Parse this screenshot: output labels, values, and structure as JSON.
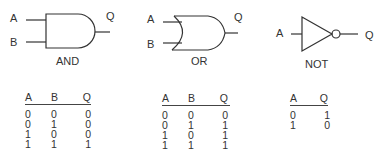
{
  "gates": [
    {
      "name": "AND",
      "inputs": [
        "A",
        "B"
      ],
      "output": "Q"
    },
    {
      "name": "OR",
      "inputs": [
        "A",
        "B"
      ],
      "output": "Q"
    },
    {
      "name": "NOT",
      "inputs": [
        "A"
      ],
      "output": "Q"
    }
  ],
  "tables": [
    {
      "headers": [
        "A",
        "B",
        "Q"
      ],
      "rows": [
        [
          "0",
          "0",
          "0"
        ],
        [
          "0",
          "1",
          "0"
        ],
        [
          "1",
          "0",
          "0"
        ],
        [
          "1",
          "1",
          "1"
        ]
      ]
    },
    {
      "headers": [
        "A",
        "B",
        "Q"
      ],
      "rows": [
        [
          "0",
          "0",
          "0"
        ],
        [
          "0",
          "1",
          "1"
        ],
        [
          "1",
          "0",
          "1"
        ],
        [
          "1",
          "1",
          "1"
        ]
      ]
    },
    {
      "headers": [
        "A",
        "Q"
      ],
      "rows": [
        [
          "0",
          "1"
        ],
        [
          "1",
          "0"
        ]
      ]
    }
  ],
  "colors": {
    "stroke": "#333333",
    "background": "#ffffff"
  }
}
